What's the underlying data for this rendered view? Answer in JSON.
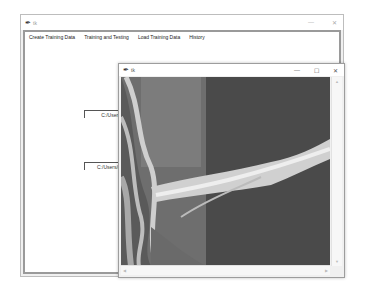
{
  "main_window": {
    "title": "tk",
    "controls": {
      "minimize": "—",
      "close": "✕"
    },
    "tabs": [
      {
        "label": "Create Training Data"
      },
      {
        "label": "Training and Testing"
      },
      {
        "label": "Load Training Data"
      },
      {
        "label": "History"
      }
    ],
    "path_fields": [
      {
        "value": "C:/Users/"
      },
      {
        "value": "C:/Users/cr"
      }
    ]
  },
  "popup_window": {
    "title": "tk",
    "controls": {
      "minimize": "—",
      "maximize": "☐",
      "close": "✕"
    },
    "image": {
      "description": "grayscale satellite image of river"
    }
  },
  "colors": {
    "window_bg": "#f0f0f0",
    "client_border": "#9a9a9a",
    "image_dark": "#4a4a4a",
    "image_mid": "#7a7a7a",
    "image_light": "#d0d0d0"
  }
}
